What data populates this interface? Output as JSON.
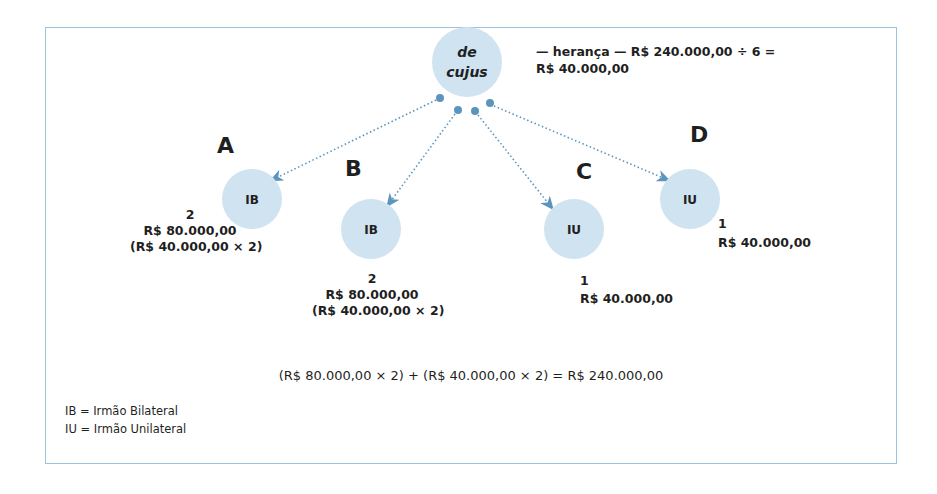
{
  "diagram": {
    "root": {
      "label_line1": "de",
      "label_line2": "cujus",
      "note_line1": "— herança — R$ 240.000,00 ÷ 6 =",
      "note_line2": "R$ 40.000,00"
    },
    "heirs": [
      {
        "letter": "A",
        "type": "IB",
        "shares": "2",
        "amount": "R$ 80.000,00",
        "calc": "(R$ 40.000,00 × 2)"
      },
      {
        "letter": "B",
        "type": "IB",
        "shares": "2",
        "amount": "R$ 80.000,00",
        "calc": "(R$ 40.000,00 × 2)"
      },
      {
        "letter": "C",
        "type": "IU",
        "shares": "1",
        "amount": "R$ 40.000,00"
      },
      {
        "letter": "D",
        "type": "IU",
        "shares": "1",
        "amount": "R$ 40.000,00"
      }
    ],
    "equation": "(R$ 80.000,00 × 2) + (R$ 40.000,00 × 2) = R$ 240.000,00",
    "legend": [
      "IB = Irmão Bilateral",
      "IU = Irmão Unilateral"
    ],
    "colors": {
      "circle_fill": "#cfe3f0",
      "arrow": "#5b95bd",
      "border": "#9ec4dd",
      "text": "#1f1f1f"
    }
  }
}
